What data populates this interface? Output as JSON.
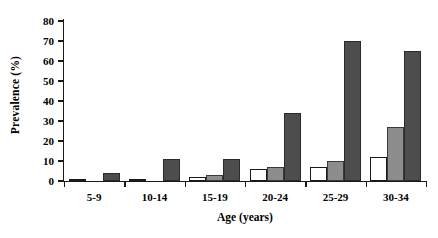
{
  "chart_data": {
    "type": "bar",
    "title": "",
    "subtitle": "",
    "xlabel": "Age (years)",
    "ylabel": "Prevalence (%)",
    "categories": [
      "5-9",
      "10-14",
      "15-19",
      "20-24",
      "25-29",
      "30-34"
    ],
    "ylim": [
      0,
      80
    ],
    "yticks": [
      0,
      10,
      20,
      30,
      40,
      50,
      60,
      70,
      80
    ],
    "ytick_labels": [
      "0",
      "10",
      "20",
      "30",
      "40",
      "50",
      "60",
      "70",
      "80"
    ],
    "grid": false,
    "legend": "none",
    "series": [
      {
        "name": "series-1",
        "color": "#ffffff",
        "edge_color": "#1a1a1a",
        "values": [
          0.5,
          0.3,
          2.0,
          6.0,
          7.0,
          12.0
        ]
      },
      {
        "name": "series-2",
        "color": "#8d8d8d",
        "edge_color": "#3a3a3a",
        "values": [
          0.0,
          0.0,
          3.0,
          7.0,
          10.0,
          27.0
        ]
      },
      {
        "name": "series-3",
        "color": "#4d4d4d",
        "edge_color": "#2b2b2b",
        "values": [
          4.0,
          11.0,
          11.0,
          34.0,
          70.0,
          65.0
        ]
      }
    ]
  },
  "axes": {
    "y_title": "Prevalence (%)",
    "x_title": "Age (years)"
  }
}
